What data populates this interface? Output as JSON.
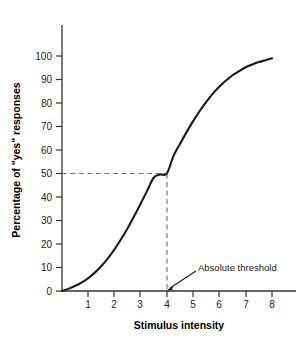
{
  "chart_data": {
    "type": "line",
    "title": "",
    "xlabel": "Stimulus intensity",
    "ylabel": "Percentage of \"yes\" responses",
    "xlim": [
      0,
      8.5
    ],
    "ylim": [
      0,
      105
    ],
    "grid": false,
    "legend": null,
    "x_ticks": [
      "1",
      "2",
      "3",
      "4",
      "5",
      "6",
      "7",
      "8"
    ],
    "x_tick_values": [
      1,
      2,
      3,
      4,
      5,
      6,
      7,
      8
    ],
    "y_ticks": [
      "0",
      "10",
      "20",
      "30",
      "40",
      "50",
      "60",
      "70",
      "80",
      "90",
      "100"
    ],
    "y_tick_values": [
      0,
      10,
      20,
      30,
      40,
      50,
      60,
      70,
      80,
      90,
      100
    ],
    "series": [
      {
        "name": "Psychometric function",
        "color": "#1a1a1a",
        "x": [
          0.0,
          0.25,
          0.5,
          0.75,
          1.0,
          1.25,
          1.5,
          1.75,
          2.0,
          2.25,
          2.5,
          2.75,
          3.0,
          3.25,
          3.5,
          3.75,
          4.0,
          4.25,
          4.5,
          4.75,
          5.0,
          5.25,
          5.5,
          5.75,
          6.0,
          6.25,
          6.5,
          6.75,
          7.0,
          7.25,
          7.5,
          7.75,
          8.0
        ],
        "values": [
          0.0,
          0.9,
          2.1,
          3.6,
          5.4,
          7.7,
          10.5,
          13.8,
          17.6,
          21.9,
          26.6,
          31.7,
          37.1,
          42.6,
          48.2,
          49.6,
          50.0,
          57.4,
          62.6,
          67.6,
          72.3,
          76.6,
          80.5,
          84.0,
          87.0,
          89.6,
          91.8,
          93.6,
          95.2,
          96.4,
          97.4,
          98.2,
          99.0
        ]
      }
    ],
    "reference_lines": [
      {
        "name": "threshold-horizontal",
        "orientation": "horizontal",
        "value": 50,
        "style": "dashed",
        "from_x": 0,
        "to_x": 4
      },
      {
        "name": "threshold-vertical",
        "orientation": "vertical",
        "value": 4,
        "style": "dashed",
        "from_y": 0,
        "to_y": 50
      }
    ],
    "annotations": [
      {
        "name": "absolute-threshold",
        "text": "Absolute threshold",
        "points_to_x": 4,
        "points_to_y": 0
      }
    ]
  },
  "axes": {
    "x_title": "Stimulus intensity",
    "y_title": "Percentage of \"yes\" responses"
  },
  "annotation": {
    "absolute_threshold_label": "Absolute threshold"
  },
  "colors": {
    "curve": "#1a1a1a",
    "axis": "#333333",
    "dashed": "#777777",
    "text": "#1a1a1a",
    "background": "#ffffff"
  }
}
